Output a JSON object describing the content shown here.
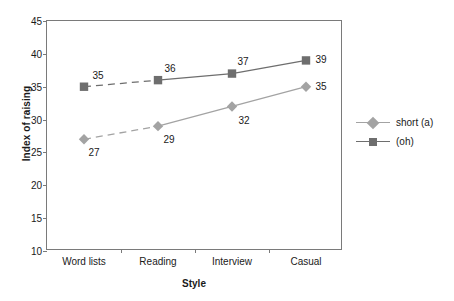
{
  "chart_data": {
    "type": "line",
    "title": "",
    "xlabel": "Style",
    "ylabel": "Index of raising",
    "categories": [
      "Word lists",
      "Reading",
      "Interview",
      "Casual"
    ],
    "ylim": [
      10,
      45
    ],
    "yticks": [
      10,
      15,
      20,
      25,
      30,
      35,
      40,
      45
    ],
    "ytick_labels": [
      "10",
      "15",
      "20",
      "25",
      "30",
      "35",
      "40",
      "45"
    ],
    "grid": false,
    "legend_position": "right",
    "series": [
      {
        "name": "short (a)",
        "marker": "diamond",
        "color": "#a3a3a3",
        "line_color": "#a3a3a3",
        "values": [
          27,
          29,
          32,
          35
        ],
        "labels": [
          "27",
          "29",
          "32",
          "35"
        ],
        "dashed_segments": [
          0
        ]
      },
      {
        "name": "(oh)",
        "marker": "square",
        "color": "#6e6e6e",
        "line_color": "#6e6e6e",
        "values": [
          35,
          36,
          37,
          39
        ],
        "labels": [
          "35",
          "36",
          "37",
          "39"
        ],
        "dashed_segments": [
          0
        ]
      }
    ]
  },
  "legend": {
    "items": [
      {
        "label": "short (a)",
        "marker": "diamond-marker-icon"
      },
      {
        "label": "(oh)",
        "marker": "square-marker-icon"
      }
    ]
  },
  "colors": {
    "axis": "#7a7a7a",
    "text": "#1a1a1a",
    "series_short_a": "#a3a3a3",
    "series_oh": "#6e6e6e",
    "background": "#ffffff"
  }
}
